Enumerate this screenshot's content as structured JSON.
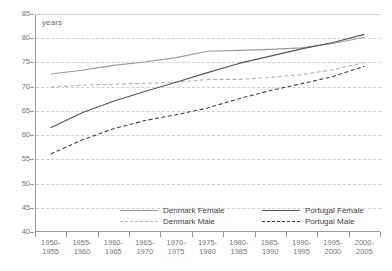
{
  "chart_data": {
    "type": "line",
    "title": "",
    "xlabel": "",
    "ylabel": "years",
    "ylim": [
      40,
      85
    ],
    "ytick_step": 5,
    "yticks": [
      85,
      80,
      75,
      70,
      65,
      60,
      55,
      50,
      45,
      40
    ],
    "grid": true,
    "legend_position": "bottom-inside",
    "categories": [
      "1950-\n1955",
      "1955-\n1960",
      "1960-\n1965",
      "1965-\n1970",
      "1970-\n1975",
      "1975-\n1980",
      "1980-\n1985",
      "1985-\n1990",
      "1990-\n1995",
      "1995-\n2000",
      "2000-\n2005"
    ],
    "category_labels": [
      {
        "top": "1950-",
        "bottom": "1955"
      },
      {
        "top": "1955-",
        "bottom": "1960"
      },
      {
        "top": "1960-",
        "bottom": "1965"
      },
      {
        "top": "1965-",
        "bottom": "1970"
      },
      {
        "top": "1970-",
        "bottom": "1975"
      },
      {
        "top": "1975-",
        "bottom": "1980"
      },
      {
        "top": "1980-",
        "bottom": "1985"
      },
      {
        "top": "1985-",
        "bottom": "1990"
      },
      {
        "top": "1990-",
        "bottom": "1995"
      },
      {
        "top": "1995-",
        "bottom": "2000"
      },
      {
        "top": "2000-",
        "bottom": "2005"
      }
    ],
    "series": [
      {
        "name": "Denmark Female",
        "style": "solid",
        "color": "#9a9a9d",
        "values": [
          72.6,
          73.4,
          74.4,
          75.1,
          76.0,
          77.3,
          77.5,
          77.7,
          78.0,
          78.9,
          80.2
        ]
      },
      {
        "name": "Denmark Male",
        "style": "dashed",
        "color": "#b4b4b7",
        "values": [
          69.9,
          70.3,
          70.5,
          70.7,
          70.9,
          71.5,
          71.5,
          71.9,
          72.5,
          73.5,
          75.0
        ]
      },
      {
        "name": "Portugal Female",
        "style": "solid",
        "color": "#555558",
        "values": [
          61.5,
          64.6,
          67.0,
          69.0,
          70.9,
          72.9,
          74.8,
          76.3,
          77.8,
          79.1,
          80.8
        ]
      },
      {
        "name": "Portugal Male",
        "style": "dashed",
        "color": "#3f3f42",
        "values": [
          56.1,
          59.0,
          61.3,
          63.0,
          64.2,
          65.6,
          67.5,
          69.2,
          70.6,
          72.1,
          74.2
        ]
      }
    ]
  },
  "legend": {
    "items": [
      {
        "label": "Denmark Female",
        "style": "solid",
        "color": "#9a9a9d"
      },
      {
        "label": "Denmark Male",
        "style": "dashed",
        "color": "#b4b4b7"
      },
      {
        "label": "Portugal Female",
        "style": "solid",
        "color": "#555558"
      },
      {
        "label": "Portugal Male",
        "style": "dashed",
        "color": "#3f3f42"
      }
    ]
  },
  "axis": {
    "unit_label": "years"
  },
  "colors": {
    "axis": "#9a9a9d",
    "grid": "#cfcfd2",
    "text": "#77777a"
  }
}
